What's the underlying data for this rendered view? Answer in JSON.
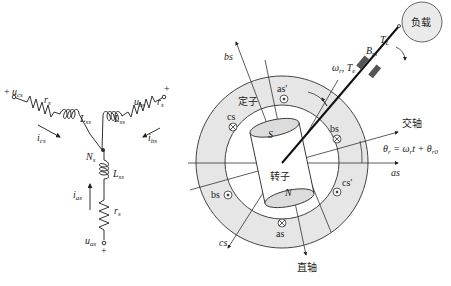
{
  "circuit": {
    "phase_a": {
      "voltage": "u",
      "voltage_sub": "as",
      "current": "i",
      "current_sub": "as",
      "resistor": "r",
      "resistor_sub": "s",
      "inductor": "L",
      "inductor_sub": "ss",
      "polarity": "+"
    },
    "phase_b": {
      "voltage": "u",
      "voltage_sub": "bs",
      "current": "i",
      "current_sub": "bs",
      "resistor": "r",
      "resistor_sub": "s",
      "inductor": "L",
      "inductor_sub": "ss",
      "polarity": "+"
    },
    "phase_c": {
      "voltage": "u",
      "voltage_sub": "cs",
      "current": "i",
      "current_sub": "cs",
      "resistor": "r",
      "resistor_sub": "s",
      "inductor": "L",
      "inductor_sub": "ss",
      "polarity": "+"
    },
    "neutral": {
      "label": "N",
      "label_sub": "s"
    }
  },
  "machine": {
    "stator_label": "定子",
    "rotor_label": "转子",
    "north_pole": "N",
    "south_pole": "S",
    "windings": {
      "as": "as",
      "as_prime": "as′",
      "bs": "bs",
      "bs_prime": "bs",
      "cs": "cs",
      "cs_prime": "cs′"
    },
    "axes": {
      "as": "as",
      "bs": "bs",
      "cs": "cs",
      "q_axis": "交轴",
      "d_axis": "直轴"
    },
    "angle": {
      "lhs": "θ",
      "lhs_sub": "r",
      "eq": " = ω",
      "eq_sub": "r",
      "t": "t",
      "plus": " + θ",
      "plus_sub": "r0"
    },
    "load": {
      "label": "负载",
      "torque": "T",
      "torque_sub": "L",
      "damping": "B",
      "damping_sub": "m"
    },
    "shaft": {
      "speed": "ω",
      "speed_sub": "r",
      "sep": ", ",
      "torque": "T",
      "torque_sub": "e"
    }
  },
  "colors": {
    "ring_fill": "#e6e6e6",
    "line": "#333333",
    "rotor_fill": "#ffffff",
    "pole_fill": "#dcdcdc"
  }
}
